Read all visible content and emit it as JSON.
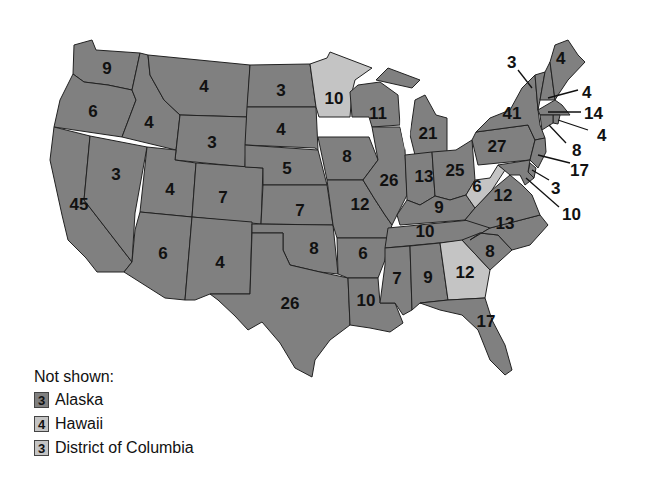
{
  "map": {
    "title": "Electoral votes by state",
    "shade_colors": {
      "dark": "#808080",
      "light": "#c4c4c4"
    },
    "states": [
      {
        "name": "Washington",
        "votes": "9",
        "shade": "dark"
      },
      {
        "name": "Oregon",
        "votes": "6",
        "shade": "dark"
      },
      {
        "name": "California",
        "votes": "45",
        "shade": "dark"
      },
      {
        "name": "Nevada",
        "votes": "3",
        "shade": "dark"
      },
      {
        "name": "Idaho",
        "votes": "4",
        "shade": "dark"
      },
      {
        "name": "Montana",
        "votes": "4",
        "shade": "dark"
      },
      {
        "name": "Wyoming",
        "votes": "3",
        "shade": "dark"
      },
      {
        "name": "Utah",
        "votes": "4",
        "shade": "dark"
      },
      {
        "name": "Colorado",
        "votes": "7",
        "shade": "dark"
      },
      {
        "name": "Arizona",
        "votes": "6",
        "shade": "dark"
      },
      {
        "name": "New Mexico",
        "votes": "4",
        "shade": "dark"
      },
      {
        "name": "North Dakota",
        "votes": "3",
        "shade": "dark"
      },
      {
        "name": "South Dakota",
        "votes": "4",
        "shade": "dark"
      },
      {
        "name": "Nebraska",
        "votes": "5",
        "shade": "dark"
      },
      {
        "name": "Kansas",
        "votes": "7",
        "shade": "dark"
      },
      {
        "name": "Oklahoma",
        "votes": "8",
        "shade": "dark"
      },
      {
        "name": "Texas",
        "votes": "26",
        "shade": "dark"
      },
      {
        "name": "Minnesota",
        "votes": "10",
        "shade": "light"
      },
      {
        "name": "Iowa",
        "votes": "8",
        "shade": "dark"
      },
      {
        "name": "Missouri",
        "votes": "12",
        "shade": "dark"
      },
      {
        "name": "Arkansas",
        "votes": "6",
        "shade": "dark"
      },
      {
        "name": "Louisiana",
        "votes": "10",
        "shade": "dark"
      },
      {
        "name": "Wisconsin",
        "votes": "11",
        "shade": "dark"
      },
      {
        "name": "Illinois",
        "votes": "26",
        "shade": "dark"
      },
      {
        "name": "Michigan",
        "votes": "21",
        "shade": "dark"
      },
      {
        "name": "Indiana",
        "votes": "13",
        "shade": "dark"
      },
      {
        "name": "Ohio",
        "votes": "25",
        "shade": "dark"
      },
      {
        "name": "Kentucky",
        "votes": "9",
        "shade": "dark"
      },
      {
        "name": "Tennessee",
        "votes": "10",
        "shade": "dark"
      },
      {
        "name": "Mississippi",
        "votes": "7",
        "shade": "dark"
      },
      {
        "name": "Alabama",
        "votes": "9",
        "shade": "dark"
      },
      {
        "name": "Georgia",
        "votes": "12",
        "shade": "light"
      },
      {
        "name": "Florida",
        "votes": "17",
        "shade": "dark"
      },
      {
        "name": "South Carolina",
        "votes": "8",
        "shade": "dark"
      },
      {
        "name": "North Carolina",
        "votes": "13",
        "shade": "dark"
      },
      {
        "name": "Virginia",
        "votes": "12",
        "shade": "dark"
      },
      {
        "name": "West Virginia",
        "votes": "6",
        "shade": "light"
      },
      {
        "name": "Pennsylvania",
        "votes": "27",
        "shade": "dark"
      },
      {
        "name": "New York",
        "votes": "41",
        "shade": "dark"
      },
      {
        "name": "Vermont",
        "votes": "3",
        "shade": "dark"
      },
      {
        "name": "New Hampshire",
        "votes": "4",
        "shade": "dark"
      },
      {
        "name": "Maine",
        "votes": "4",
        "shade": "dark"
      },
      {
        "name": "Massachusetts",
        "votes": "14",
        "shade": "dark"
      },
      {
        "name": "Rhode Island",
        "votes": "4",
        "shade": "dark"
      },
      {
        "name": "Connecticut",
        "votes": "8",
        "shade": "dark"
      },
      {
        "name": "New Jersey",
        "votes": "17",
        "shade": "dark"
      },
      {
        "name": "Delaware",
        "votes": "3",
        "shade": "dark"
      },
      {
        "name": "Maryland",
        "votes": "10",
        "shade": "dark"
      }
    ]
  },
  "legend": {
    "title": "Not shown:",
    "items": [
      {
        "votes": "3",
        "label": "Alaska",
        "shade": "dark"
      },
      {
        "votes": "4",
        "label": "Hawaii",
        "shade": "light"
      },
      {
        "votes": "3",
        "label": "District of Columbia",
        "shade": "light"
      }
    ]
  }
}
